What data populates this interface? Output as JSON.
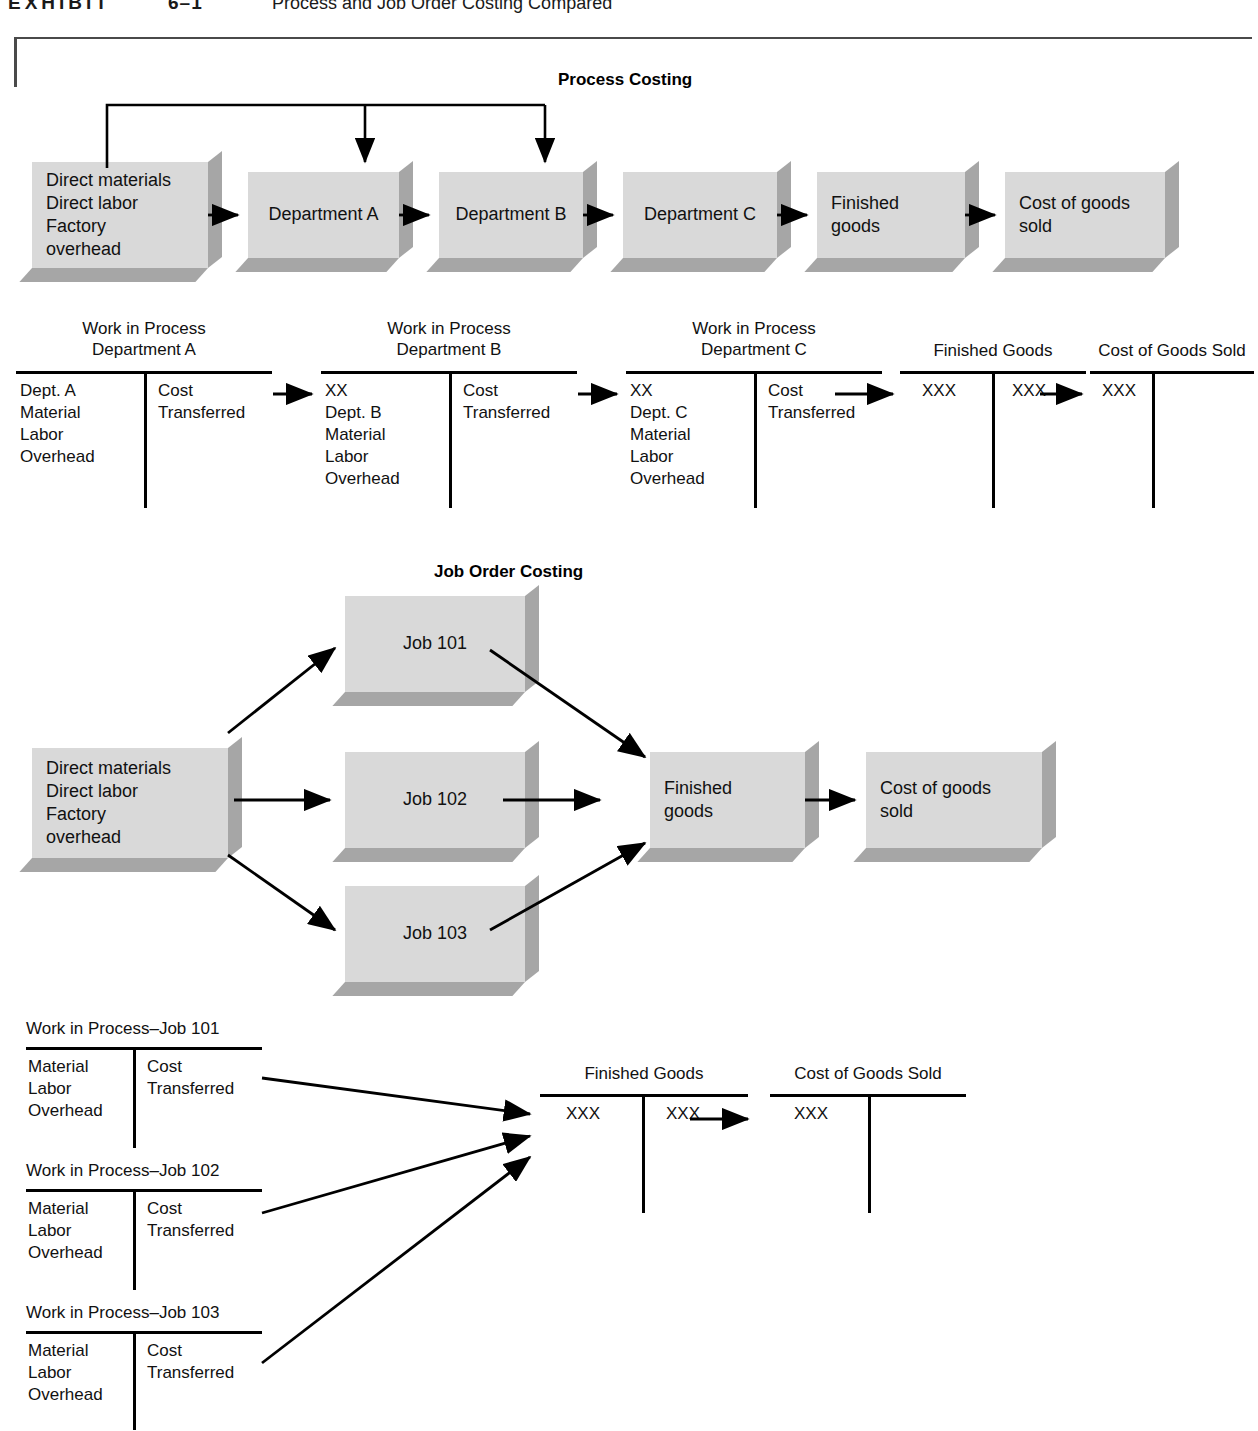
{
  "exhibit": {
    "label": "EXHIBIT",
    "number": "6–1",
    "title": "Process and Job Order Costing Compared"
  },
  "process_costing": {
    "heading": "Process Costing",
    "boxes": [
      {
        "id": "inputs",
        "text": "Direct materials\nDirect labor\nFactory\n   overhead"
      },
      {
        "id": "department-a",
        "text": "Department A"
      },
      {
        "id": "department-b",
        "text": "Department B"
      },
      {
        "id": "department-c",
        "text": "Department C"
      },
      {
        "id": "finished-goods",
        "text": "Finished\ngoods"
      },
      {
        "id": "cogs",
        "text": "Cost of goods\nsold"
      }
    ],
    "t_accounts": [
      {
        "id": "wip-dept-a",
        "title": "Work in Process\nDepartment A",
        "debit": "Dept. A\nMaterial\nLabor\nOverhead",
        "credit": "Cost\nTransferred"
      },
      {
        "id": "wip-dept-b",
        "title": "Work in Process\nDepartment B",
        "debit": "XX\nDept. B\nMaterial\nLabor\nOverhead",
        "credit": "Cost\nTransferred"
      },
      {
        "id": "wip-dept-c",
        "title": "Work in Process\nDepartment C",
        "debit": "XX\nDept. C\nMaterial\nLabor\nOverhead",
        "credit": "Cost\nTransferred"
      },
      {
        "id": "finished-goods",
        "title": "Finished Goods",
        "debit": "XXX",
        "credit": "XXX"
      },
      {
        "id": "cost-of-goods-sold",
        "title": "Cost of Goods Sold",
        "debit": "XXX",
        "credit": ""
      }
    ]
  },
  "job_order_costing": {
    "heading": "Job Order Costing",
    "boxes": [
      {
        "id": "inputs",
        "text": "Direct materials\nDirect labor\nFactory\n   overhead"
      },
      {
        "id": "job-101",
        "text": "Job 101"
      },
      {
        "id": "job-102",
        "text": "Job 102"
      },
      {
        "id": "job-103",
        "text": "Job 103"
      },
      {
        "id": "finished-goods",
        "text": "Finished\ngoods"
      },
      {
        "id": "cogs",
        "text": "Cost of goods\nsold"
      }
    ],
    "t_accounts": [
      {
        "id": "wip-job-101",
        "title": "Work in Process–Job 101",
        "debit": "Material\nLabor\nOverhead",
        "credit": "Cost\nTransferred"
      },
      {
        "id": "wip-job-102",
        "title": "Work in Process–Job 102",
        "debit": "Material\nLabor\nOverhead",
        "credit": "Cost\nTransferred"
      },
      {
        "id": "wip-job-103",
        "title": "Work in Process–Job 103",
        "debit": "Material\nLabor\nOverhead",
        "credit": "Cost\nTransferred"
      },
      {
        "id": "finished-goods",
        "title": "Finished Goods",
        "debit": "XXX",
        "credit": "XXX"
      },
      {
        "id": "cost-of-goods-sold",
        "title": "Cost of Goods Sold",
        "debit": "XXX",
        "credit": ""
      }
    ]
  },
  "colors": {
    "box_face": "#d9d9d9",
    "box_shadow": "#a6a6a6",
    "ink": "#000000",
    "frame": "#4a4a4a",
    "page": "#ffffff"
  }
}
